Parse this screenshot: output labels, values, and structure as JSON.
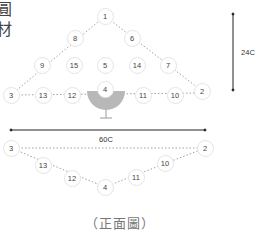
{
  "partial_text": [
    "圓",
    "材"
  ],
  "front_view": {
    "nodes": [
      {
        "label": "1",
        "x": 105,
        "y": 16
      },
      {
        "label": "8",
        "x": 75,
        "y": 38
      },
      {
        "label": "6",
        "x": 132,
        "y": 38
      },
      {
        "label": "9",
        "x": 42,
        "y": 65
      },
      {
        "label": "15",
        "x": 74,
        "y": 65
      },
      {
        "label": "5",
        "x": 105,
        "y": 65
      },
      {
        "label": "14",
        "x": 137,
        "y": 65
      },
      {
        "label": "7",
        "x": 168,
        "y": 65
      },
      {
        "label": "3",
        "x": 11,
        "y": 95
      },
      {
        "label": "13",
        "x": 43,
        "y": 95
      },
      {
        "label": "12",
        "x": 72,
        "y": 95
      },
      {
        "label": "4",
        "x": 105,
        "y": 89
      },
      {
        "label": "11",
        "x": 143,
        "y": 95
      },
      {
        "label": "10",
        "x": 175,
        "y": 95
      },
      {
        "label": "2",
        "x": 202,
        "y": 91
      }
    ],
    "height_dimension": {
      "label": "24C"
    },
    "width_dimension": {
      "label": "60C"
    }
  },
  "bottom_view": {
    "nodes": [
      {
        "label": "3",
        "x": 11,
        "y": 148
      },
      {
        "label": "2",
        "x": 205,
        "y": 148
      },
      {
        "label": "13",
        "x": 43,
        "y": 165
      },
      {
        "label": "10",
        "x": 165,
        "y": 163
      },
      {
        "label": "12",
        "x": 72,
        "y": 178
      },
      {
        "label": "11",
        "x": 136,
        "y": 177
      },
      {
        "label": "4",
        "x": 105,
        "y": 187
      }
    ]
  },
  "caption": "（正面圖）",
  "colors": {
    "line": "#888888",
    "glass": "#b5b5b5",
    "arrow": "#222222"
  }
}
